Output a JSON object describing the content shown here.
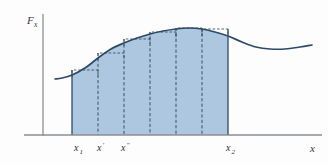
{
  "figure": {
    "title": "",
    "background_color": "#fdfdfd",
    "axes": {
      "y_axis": {
        "label_main": "F",
        "label_sub": "x",
        "label_full": "Fx",
        "color": "#8a8f96",
        "origin_x": 43,
        "top_y": 14,
        "bottom_y": 136
      },
      "x_axis": {
        "label": "x",
        "color": "#8a8f96",
        "y": 135,
        "left_x": 24,
        "right_x": 322
      }
    },
    "tick_labels": [
      {
        "name": "x1",
        "main": "x",
        "sub": "1",
        "x": 74
      },
      {
        "name": "x-prime",
        "main": "x",
        "sub": "′",
        "x": 97
      },
      {
        "name": "x-double-prime",
        "main": "x",
        "sub": "″",
        "x": 121
      }
    ],
    "tick_label_right": {
      "name": "x2",
      "main": "x",
      "sub": "2",
      "x": 226
    },
    "colors": {
      "curve": "#2d4a66",
      "fill": "#a8c4dd",
      "fill_opacity": "0.95",
      "rect_outline": "#3f4a56",
      "dashed_line": "#2b3a4a",
      "axis": "#8a8f96",
      "text": "#2f2f2f"
    }
  },
  "chart_data": {
    "type": "area",
    "title": "",
    "xlabel": "x",
    "ylabel": "Fx",
    "grid": false,
    "legend": null,
    "xlim": [
      43,
      322
    ],
    "ylim": [
      0,
      135
    ],
    "integration_bounds": {
      "x1": 72,
      "x2": 228
    },
    "strip_boundaries": [
      72,
      98,
      124,
      150,
      176,
      202,
      228
    ],
    "strip_count": 6,
    "curve_points": [
      {
        "x": 55,
        "y": 79
      },
      {
        "x": 62,
        "y": 78
      },
      {
        "x": 72,
        "y": 75
      },
      {
        "x": 85,
        "y": 68
      },
      {
        "x": 98,
        "y": 58
      },
      {
        "x": 111,
        "y": 49
      },
      {
        "x": 124,
        "y": 43
      },
      {
        "x": 137,
        "y": 38
      },
      {
        "x": 150,
        "y": 34
      },
      {
        "x": 163,
        "y": 31
      },
      {
        "x": 176,
        "y": 29
      },
      {
        "x": 189,
        "y": 28
      },
      {
        "x": 202,
        "y": 29
      },
      {
        "x": 215,
        "y": 32
      },
      {
        "x": 228,
        "y": 36
      },
      {
        "x": 242,
        "y": 42
      },
      {
        "x": 256,
        "y": 47
      },
      {
        "x": 270,
        "y": 49
      },
      {
        "x": 285,
        "y": 49
      },
      {
        "x": 300,
        "y": 47
      },
      {
        "x": 312,
        "y": 45
      }
    ],
    "rectangles": [
      {
        "index": 1,
        "x_left": 72,
        "x_right": 98,
        "top_y": 70,
        "height": 65
      },
      {
        "index": 2,
        "x_left": 98,
        "x_right": 124,
        "top_y": 53,
        "height": 82
      },
      {
        "index": 3,
        "x_left": 124,
        "x_right": 150,
        "top_y": 39,
        "height": 96
      },
      {
        "index": 4,
        "x_left": 150,
        "x_right": 176,
        "top_y": 32,
        "height": 103
      },
      {
        "index": 5,
        "x_left": 176,
        "x_right": 202,
        "top_y": 28,
        "height": 107
      },
      {
        "index": 6,
        "x_left": 202,
        "x_right": 228,
        "top_y": 29,
        "height": 106
      }
    ]
  }
}
